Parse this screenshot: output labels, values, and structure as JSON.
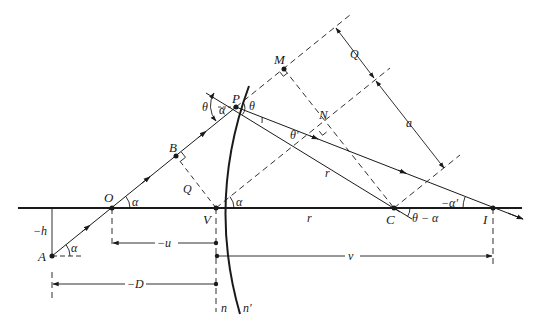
{
  "figure": {
    "type": "refraction at a spherical surface ray diagram",
    "colors": {
      "line": "#1a1a1a",
      "background": "#ffffff"
    }
  },
  "points": {
    "A": "A",
    "O": "O",
    "B": "B",
    "P": "P",
    "M": "M",
    "N": "N",
    "V": "V",
    "C": "C",
    "I": "I"
  },
  "angles": {
    "alpha_at_A": "α",
    "alpha_at_O": "α",
    "alpha_at_V": "α",
    "alpha_at_P": "α",
    "theta_left": "θ",
    "theta_right": "θ",
    "theta_prime": "θ′",
    "theta_minus_alpha": "θ − α",
    "minus_alpha_prime": "−α′"
  },
  "lengths": {
    "minus_h": "−h",
    "Q_lower": "Q",
    "Q_upper": "Q",
    "a": "a",
    "r_radius": "r",
    "r_axis": "r",
    "minus_u": "−u",
    "minus_D": "−D",
    "v": "v"
  },
  "media": {
    "n": "n",
    "n_prime": "n′"
  }
}
